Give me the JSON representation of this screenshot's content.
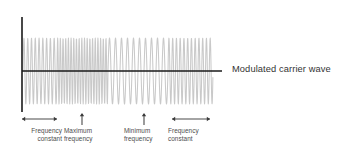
{
  "figure": {
    "caption_right": "Modulated carrier wave",
    "colors": {
      "wave": "#c9c9c9",
      "axis": "#1a1a1a",
      "marker": "#3a3a3a",
      "label_text": "#4d4d4d",
      "caption_text": "#333333",
      "background": "#ffffff"
    }
  },
  "axes": {
    "vertical": {
      "x": 22,
      "y_top": 17,
      "y_bottom": 112
    },
    "horizontal": {
      "y": 71,
      "x_start": 22,
      "x_end": 222
    }
  },
  "labels": [
    {
      "name": "frequency-constant-left",
      "line1": "Frequency",
      "line2": "constant",
      "marker": "double-arrow",
      "marker_from": 22,
      "marker_to": 57,
      "marker_y": 119
    },
    {
      "name": "maximum-frequency",
      "line1": "Maximum",
      "line2": "frequency",
      "marker": "up-arrow",
      "marker_x": 82,
      "marker_y": 119
    },
    {
      "name": "minimum-frequency",
      "line1": "Minimum",
      "line2": "frequency",
      "marker": "up-arrow",
      "marker_x": 144,
      "marker_y": 119
    },
    {
      "name": "frequency-constant-right",
      "line1": "Frequency",
      "line2": "constant",
      "marker": "double-arrow",
      "marker_from": 172,
      "marker_to": 210,
      "marker_y": 119
    }
  ],
  "chart_data": {
    "type": "line",
    "title": "Modulated carrier wave",
    "xlabel": "",
    "ylabel": "",
    "grid": false,
    "legend": "none",
    "amplitude": 1.0,
    "baseline_y": 71,
    "peak_y_top": 38,
    "peak_y_bottom": 104,
    "x_start": 23,
    "x_end": 213,
    "segments": [
      {
        "label": "Frequency constant",
        "x_start": 23,
        "x_end": 57,
        "relative_frequency": 1.0,
        "cycles": 9
      },
      {
        "label": "Maximum frequency",
        "x_start": 57,
        "x_end": 108,
        "relative_frequency": 1.45,
        "cycles": 19
      },
      {
        "label": "Minimum frequency",
        "x_start": 108,
        "x_end": 168,
        "relative_frequency": 0.62,
        "cycles": 10
      },
      {
        "label": "Frequency constant",
        "x_start": 168,
        "x_end": 213,
        "relative_frequency": 1.0,
        "cycles": 12
      }
    ]
  }
}
